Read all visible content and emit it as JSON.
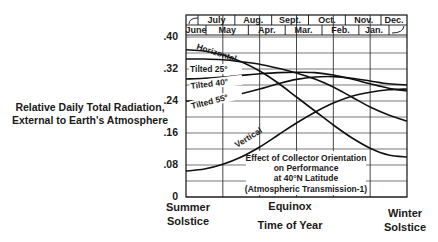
{
  "chart_data": {
    "type": "line",
    "ylabel": "Relative Daily Total Radiation, External to Earth's Atmosphere",
    "xlabel": "Time of Year",
    "ylim": [
      0,
      0.4
    ],
    "yticks": [
      "0",
      ".08",
      ".16",
      ".24",
      ".32",
      ".40"
    ],
    "x_anchor_labels": [
      "Summer Solstice",
      "Equinox",
      "Winter Solstice"
    ],
    "month_rows": {
      "top": [
        "July",
        "Aug.",
        "Sept.",
        "Oct.",
        "Nov.",
        "Dec."
      ],
      "bottom": [
        "June",
        "May",
        "Apr.",
        "Mar.",
        "Feb.",
        "Jan."
      ]
    },
    "grid": true,
    "x": [
      0,
      0.5,
      1,
      1.5,
      2,
      2.5,
      3,
      3.5,
      4,
      4.5,
      5,
      5.5,
      6
    ],
    "series": [
      {
        "name": "Horizontal",
        "values": [
          0.368,
          0.365,
          0.355,
          0.338,
          0.315,
          0.285,
          0.25,
          0.215,
          0.18,
          0.148,
          0.122,
          0.105,
          0.1
        ]
      },
      {
        "name": "Tilted 25°",
        "values": [
          0.345,
          0.345,
          0.343,
          0.338,
          0.332,
          0.322,
          0.31,
          0.295,
          0.275,
          0.25,
          0.225,
          0.205,
          0.19
        ]
      },
      {
        "name": "Tilted 40°",
        "values": [
          0.295,
          0.297,
          0.3,
          0.304,
          0.308,
          0.311,
          0.312,
          0.311,
          0.305,
          0.295,
          0.283,
          0.272,
          0.265
        ]
      },
      {
        "name": "Tilted 55°",
        "values": [
          0.24,
          0.241,
          0.247,
          0.258,
          0.27,
          0.283,
          0.294,
          0.3,
          0.301,
          0.297,
          0.29,
          0.283,
          0.28
        ]
      },
      {
        "name": "Vertical",
        "values": [
          0.065,
          0.07,
          0.082,
          0.1,
          0.125,
          0.155,
          0.185,
          0.212,
          0.235,
          0.252,
          0.262,
          0.268,
          0.27
        ]
      }
    ]
  },
  "labels": {
    "ylabel_line1": "Relative Daily Total Radiation,",
    "ylabel_line2": "External to Earth's Atmosphere",
    "summer_line1": "Summer",
    "summer_line2": "Solstice",
    "equinox": "Equinox",
    "time_of_year": "Time of Year",
    "winter_line1": "Winter",
    "winter_line2": "Solstice",
    "note_line1": "Effect of Collector Orientation",
    "note_line2": "on Performance",
    "note_line3": "at 40°N Latitude",
    "note_line4": "(Atmospheric Transmission-1)"
  }
}
